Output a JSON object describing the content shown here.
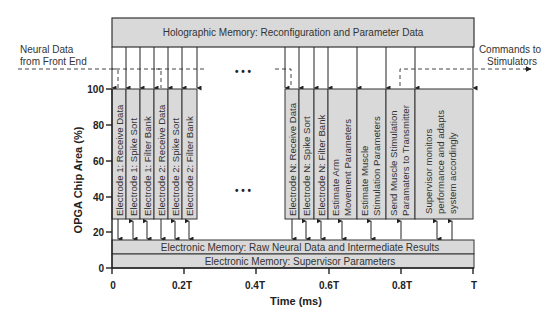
{
  "diagram": {
    "top_box": "Holographic Memory:  Reconfiguration and Parameter Data",
    "left_input": [
      "Neural Data",
      "from Front End"
    ],
    "right_output": [
      "Commands to",
      "Stimulators"
    ],
    "ellipsis": "• • •",
    "y_axis_title": "OPGA  Chip  Area (%)",
    "x_axis_title": "Time (ms)",
    "y_ticks": [
      "100",
      "80",
      "60",
      "40",
      "20",
      "0"
    ],
    "x_ticks": [
      "0",
      "0.2T",
      "0.4T",
      "0.6T",
      "0.8T",
      "T"
    ],
    "tasks_group1": [
      [
        "Electrode 1:  Receive Data"
      ],
      [
        "Electrode 1:  Spike Sort"
      ],
      [
        "Electrode 1:  Filter Bank"
      ],
      [
        "Electrode 2:  Receive Data"
      ],
      [
        "Electrode 2:  Spike Sort"
      ],
      [
        "Electrode 2:  Filter Bank"
      ]
    ],
    "tasks_group2": [
      [
        "Electrode N:  Receive Data"
      ],
      [
        "Electrode N:  Spike Sort"
      ],
      [
        "Electrode N:  Filter Bank"
      ],
      [
        "Estimate Arm",
        "Movement Parameters"
      ],
      [
        "Estimate Muscle",
        "Stimulation Parameters"
      ],
      [
        "Send Muscle Stimulation",
        "Paramaters to Transmitter"
      ],
      [
        "Supervisor monitors",
        "performance and adapts",
        "system accordingly"
      ]
    ],
    "memory_bar_1": "Electronic Memory:  Raw Neural Data and Intermediate Results",
    "memory_bar_2": "Electronic Memory:  Supervisor Parameters",
    "colors": {
      "box_fill": "#d9d9d9",
      "stroke": "#333333",
      "line": "#222222"
    }
  }
}
